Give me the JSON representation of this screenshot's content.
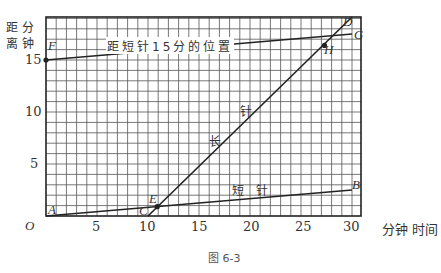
{
  "figure_caption": "图 6-3",
  "y_axis_label_line1": "距 分",
  "y_axis_label_line2": "离 钟",
  "x_axis_label": "分钟 时间",
  "origin_label": "O",
  "x_ticks": [
    "5",
    "10",
    "15",
    "20",
    "25",
    "30"
  ],
  "y_ticks": [
    "5",
    "10",
    "15"
  ],
  "line_labels": {
    "top_line": "距短针15分的位置",
    "short_hand": "短  针",
    "long_hand_1": "长",
    "long_hand_2": "针"
  },
  "points": {
    "A": {
      "label": "A",
      "x": 0,
      "y": 0
    },
    "B": {
      "label": "B",
      "x": 30,
      "y": 2.5
    },
    "C": {
      "label": "C",
      "x": 10,
      "y": 0
    },
    "D": {
      "label": "D",
      "x": 30,
      "y": 20
    },
    "E": {
      "label": "E",
      "x": 10.9,
      "y": 0.9
    },
    "F": {
      "label": "F",
      "x": 0,
      "y": 15
    },
    "G": {
      "label": "G",
      "x": 30,
      "y": 17.5
    },
    "H": {
      "label": "H",
      "x": 27.3,
      "y": 16.4
    }
  },
  "chart_data": {
    "type": "line",
    "title": "",
    "xlabel": "时间 (分钟)",
    "ylabel": "距离 (分钟)",
    "xlim": [
      0,
      30.5
    ],
    "ylim": [
      0,
      19
    ],
    "grid": true,
    "series": [
      {
        "name": "短针",
        "x": [
          0,
          30
        ],
        "y": [
          0,
          2.5
        ]
      },
      {
        "name": "长针",
        "x": [
          10,
          30
        ],
        "y": [
          0,
          20
        ]
      },
      {
        "name": "距短针15分的位置",
        "x": [
          0,
          30
        ],
        "y": [
          15,
          17.5
        ]
      }
    ],
    "annotations": [
      "A",
      "B",
      "C",
      "D",
      "E",
      "F",
      "G",
      "H"
    ],
    "caption": "图 6-3"
  }
}
